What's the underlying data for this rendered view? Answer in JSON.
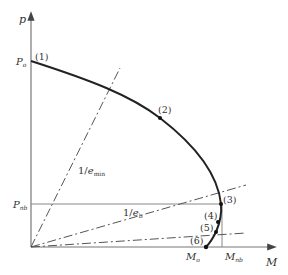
{
  "diagram": {
    "type": "interaction-diagram",
    "axes": {
      "y_label": "p",
      "x_label": "M"
    },
    "y_ticks": {
      "p0": {
        "main": "P",
        "sub": "o"
      },
      "pnb": {
        "main": "P",
        "sub": "nb"
      }
    },
    "x_ticks": {
      "m0": {
        "main": "M",
        "sub": "o"
      },
      "mnb": {
        "main": "M",
        "sub": "nb"
      }
    },
    "points": [
      {
        "label": "(1)"
      },
      {
        "label": "(2)"
      },
      {
        "label": "(3)"
      },
      {
        "label": "(4)"
      },
      {
        "label": "(5)"
      },
      {
        "label": "(6)"
      }
    ],
    "lines": {
      "emin": {
        "prefix": "1/",
        "main": "e",
        "sub": "min"
      },
      "eb": {
        "prefix": "1/",
        "main": "e",
        "sub": "b"
      }
    },
    "colors": {
      "curve": "#222222",
      "axis": "#777777",
      "guide": "#555555"
    }
  }
}
